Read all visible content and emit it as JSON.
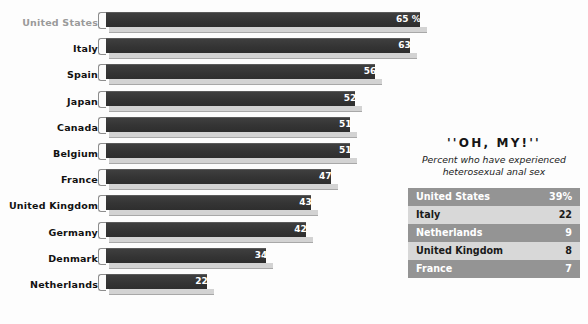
{
  "chart_data": {
    "type": "bar",
    "orientation": "horizontal",
    "title": "",
    "xlabel": "",
    "ylabel": "",
    "unit_suffix": "%",
    "xlim": [
      0,
      65
    ],
    "grid": false,
    "legend": null,
    "categories": [
      "United States",
      "Italy",
      "Spain",
      "Japan",
      "Canada",
      "Belgium",
      "France",
      "United Kingdom",
      "Germany",
      "Denmark",
      "Netherlands"
    ],
    "values": [
      65,
      63,
      56,
      52,
      51,
      51,
      47,
      43,
      42,
      34,
      22
    ],
    "value_labels": [
      "65 %",
      "63",
      "56",
      "52",
      "51",
      "51",
      "47",
      "43",
      "42",
      "34",
      "22"
    ],
    "highlighted_category": "United States"
  },
  "bars": [
    {
      "label": "United States",
      "value": 65,
      "value_label": "65 %",
      "muted_label": true
    },
    {
      "label": "Italy",
      "value": 63,
      "value_label": "63",
      "muted_label": false
    },
    {
      "label": "Spain",
      "value": 56,
      "value_label": "56",
      "muted_label": false
    },
    {
      "label": "Japan",
      "value": 52,
      "value_label": "52",
      "muted_label": false
    },
    {
      "label": "Canada",
      "value": 51,
      "value_label": "51",
      "muted_label": false
    },
    {
      "label": "Belgium",
      "value": 51,
      "value_label": "51",
      "muted_label": false
    },
    {
      "label": "France",
      "value": 47,
      "value_label": "47",
      "muted_label": false
    },
    {
      "label": "United Kingdom",
      "value": 43,
      "value_label": "43",
      "muted_label": false
    },
    {
      "label": "Germany",
      "value": 42,
      "value_label": "42",
      "muted_label": false
    },
    {
      "label": "Denmark",
      "value": 34,
      "value_label": "34",
      "muted_label": false
    },
    {
      "label": "Netherlands",
      "value": 22,
      "value_label": "22",
      "muted_label": false
    }
  ],
  "side_panel": {
    "title": "''OH, MY!''",
    "subtitle_line1": "Percent who have experienced",
    "subtitle_line2": "heterosexual anal sex",
    "table": {
      "rows": [
        {
          "country": "United States",
          "value": "39%"
        },
        {
          "country": "Italy",
          "value": "22"
        },
        {
          "country": "Netherlands",
          "value": "9"
        },
        {
          "country": "United Kingdom",
          "value": "8"
        },
        {
          "country": "France",
          "value": "7"
        }
      ]
    }
  },
  "colors": {
    "bar_fill": "#3a3a3a",
    "bar_shadow": "#d3d3d3",
    "bar_cap": "#fbfbfb",
    "label_text": "#111111",
    "label_muted": "#9a9a9a",
    "value_text": "#ffffff",
    "table_row_dark": "#949494",
    "table_row_light": "#d8d8d8",
    "background": "#fdfdfd"
  }
}
